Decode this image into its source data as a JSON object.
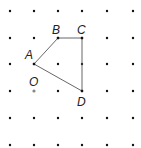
{
  "diagram": {
    "type": "dot-grid-polygon",
    "grid": {
      "columns": 6,
      "rows": 6
    },
    "points": [
      {
        "name": "A",
        "label": "A",
        "col": 1,
        "row": 2
      },
      {
        "name": "B",
        "label": "B",
        "col": 2,
        "row": 1
      },
      {
        "name": "C",
        "label": "C",
        "col": 3,
        "row": 1
      },
      {
        "name": "D",
        "label": "D",
        "col": 3,
        "row": 3
      },
      {
        "name": "O",
        "label": "O",
        "col": 1,
        "row": 3,
        "highlight": true
      }
    ],
    "polygon": [
      "A",
      "B",
      "C",
      "D"
    ],
    "colors": {
      "dot": "#111111",
      "origin_dot": "#888888",
      "line": "#555555",
      "label": "#222222"
    }
  }
}
